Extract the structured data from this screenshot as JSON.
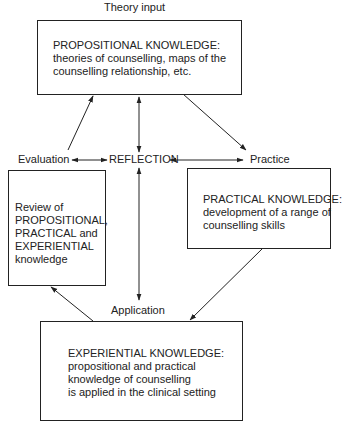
{
  "diagram": {
    "theory_input_label": "Theory input",
    "evaluation_label": "Evaluation",
    "reflection_label": "REFLECTION",
    "practice_label": "Practice",
    "application_label": "Application",
    "propositional_box": {
      "heading": "PROPOSITIONAL KNOWLEDGE:",
      "lines": [
        "theories of counselling, maps of the",
        "counselling relationship, etc."
      ]
    },
    "review_box": {
      "lines": [
        "Review of",
        "PROPOSITIONAL,",
        "PRACTICAL and",
        "EXPERIENTIAL",
        "knowledge"
      ]
    },
    "practical_box": {
      "heading": "PRACTICAL KNOWLEDGE:",
      "lines": [
        "development of a range of",
        "counselling skills"
      ]
    },
    "experiential_box": {
      "heading": "EXPERIENTIAL KNOWLEDGE:",
      "lines": [
        "propositional and practical",
        "knowledge of counselling",
        "is applied in the clinical setting"
      ]
    },
    "colors": {
      "line": "#222222",
      "background": "#ffffff"
    }
  }
}
